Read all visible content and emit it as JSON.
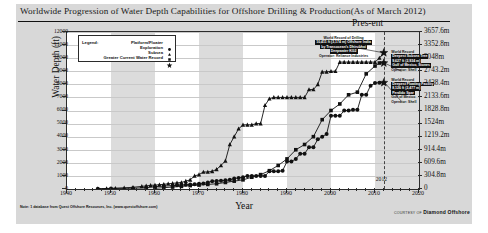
{
  "figure": {
    "title": "Worldwide Progression of Water Depth Capabilities for Offshore Drilling & Production(As of March 2012)",
    "present_label": "Pres-ent",
    "year_marker_label": "2012",
    "footnote": "Note: 1 database from Quest Offshore Resources, Inc. (www.questoffshore.com)",
    "courtesy_prefix": "COURTESY OF",
    "courtesy_brand": "Diamond Offshore"
  },
  "legend": {
    "title": "Legend:",
    "items": [
      {
        "label": "Platform/Floater",
        "marker": "circle-marker"
      },
      {
        "label": "Exploration",
        "marker": "triangle-marker"
      },
      {
        "label": "Subsea",
        "marker": "square-marker"
      },
      {
        "label": "Greater Current Water Record",
        "marker": "star-marker"
      }
    ]
  },
  "annotations": [
    {
      "name": "annotation-drilling-record",
      "lines": [
        "World Record of Drilling",
        "10,411 ft (3,174 m) Offshore India",
        "by Transocean's Dhirubhai",
        "Deepwater KG2",
        "Operator: Reliance Industries"
      ]
    },
    {
      "name": "annotation-subsea-record",
      "lines": [
        "World Record",
        "Deepest Subsea Tree",
        "9,627 ft (2,934 m)",
        "Gulf of Mexico, Stones",
        "Operator: Shell"
      ]
    },
    {
      "name": "annotation-platform-record",
      "lines": [
        "World Record",
        "Deepest Floating Facility",
        "8,126 ft (2,477 m)",
        "Perdido Spar",
        "Gulf of Mexico",
        "Operator: Shell"
      ]
    }
  ],
  "chart_data": {
    "type": "line",
    "title": "Worldwide Progression of Water Depth Capabilities for Offshore Drilling & Production(As of March 2012)",
    "xlabel": "Year",
    "ylabel": "Water Depth (ft)",
    "ylabel_right": "Water Depth (m)",
    "xlim": [
      1940,
      2020
    ],
    "ylim": [
      0,
      12000
    ],
    "grid": true,
    "legend_position": "top-left",
    "x_ticks": [
      1940,
      1950,
      1960,
      1970,
      1980,
      1990,
      2000,
      2010,
      2020
    ],
    "y_ticks": [
      0,
      1000,
      2000,
      3000,
      4000,
      5000,
      6000,
      7000,
      8000,
      9000,
      10000,
      11000,
      12000
    ],
    "y_ticks_right_m": [
      "0",
      "304.8m",
      "609.6m",
      "914.4m",
      "1219.2m",
      "1524m",
      "1828.8m",
      "2133.6m",
      "2438.4m",
      "2743.2m",
      "3048m",
      "3352.8m",
      "3657.6m"
    ],
    "series": [
      {
        "name": "Exploration",
        "marker": "triangle-marker",
        "x": [
          1947,
          1949,
          1951,
          1953,
          1955,
          1957,
          1958,
          1959,
          1960,
          1961,
          1962,
          1963,
          1964,
          1965,
          1966,
          1967,
          1968,
          1969,
          1970,
          1971,
          1972,
          1973,
          1974,
          1975,
          1976,
          1977,
          1978,
          1979,
          1980,
          1981,
          1982,
          1983,
          1984,
          1985,
          1986,
          1987,
          1988,
          1989,
          1990,
          1991,
          1992,
          1993,
          1994,
          1995,
          1996,
          1997,
          1998,
          1999,
          2000,
          2001,
          2002,
          2003,
          2004,
          2005,
          2006,
          2007,
          2008,
          2009,
          2010,
          2011,
          2012
        ],
        "values": [
          20,
          40,
          60,
          90,
          130,
          200,
          240,
          280,
          300,
          330,
          360,
          400,
          430,
          470,
          500,
          600,
          700,
          1000,
          1100,
          1300,
          1300,
          1350,
          1500,
          1800,
          2150,
          3400,
          4000,
          4600,
          4900,
          4900,
          4900,
          5000,
          5000,
          6400,
          6900,
          7000,
          7000,
          7000,
          7000,
          7000,
          7000,
          7000,
          7000,
          7600,
          7600,
          8000,
          8950,
          8950,
          9000,
          9000,
          9700,
          9700,
          9700,
          9700,
          9700,
          9700,
          9700,
          9700,
          9700,
          10011,
          10411
        ]
      },
      {
        "name": "Platform/Floater",
        "marker": "circle-marker",
        "x": [
          1947,
          1950,
          1955,
          1958,
          1960,
          1962,
          1964,
          1965,
          1966,
          1967,
          1968,
          1969,
          1970,
          1971,
          1972,
          1973,
          1974,
          1975,
          1976,
          1977,
          1978,
          1979,
          1980,
          1981,
          1982,
          1983,
          1984,
          1985,
          1986,
          1987,
          1988,
          1989,
          1990,
          1991,
          1992,
          1993,
          1994,
          1995,
          1996,
          1997,
          1998,
          1999,
          2000,
          2001,
          2002,
          2003,
          2004,
          2005,
          2006,
          2007,
          2008,
          2009,
          2010,
          2011,
          2012
        ],
        "values": [
          20,
          40,
          60,
          100,
          180,
          220,
          250,
          280,
          300,
          320,
          350,
          370,
          400,
          420,
          500,
          600,
          620,
          640,
          660,
          700,
          800,
          850,
          900,
          1000,
          1000,
          1000,
          1000,
          1000,
          1350,
          1350,
          1350,
          1400,
          2100,
          2100,
          2300,
          2700,
          2700,
          3200,
          3200,
          3800,
          4000,
          4200,
          5600,
          5600,
          5600,
          6000,
          6000,
          6050,
          6050,
          7200,
          7200,
          7900,
          8100,
          8126,
          8126
        ]
      },
      {
        "name": "Subsea",
        "marker": "square-marker",
        "x": [
          1960,
          1962,
          1964,
          1966,
          1968,
          1970,
          1972,
          1974,
          1976,
          1978,
          1980,
          1982,
          1984,
          1986,
          1988,
          1990,
          1992,
          1994,
          1996,
          1998,
          2000,
          2002,
          2004,
          2006,
          2008,
          2010,
          2011,
          2012
        ],
        "values": [
          60,
          100,
          150,
          200,
          260,
          300,
          350,
          400,
          500,
          600,
          700,
          900,
          1100,
          1400,
          1800,
          2300,
          3000,
          3400,
          4000,
          5300,
          6000,
          6500,
          7200,
          7400,
          8800,
          9400,
          9627,
          9627
        ]
      }
    ],
    "record_markers": [
      {
        "name": "record-drilling",
        "x": 2012,
        "y": 10411,
        "marker": "star-marker"
      },
      {
        "name": "record-subsea",
        "x": 2012,
        "y": 9627,
        "marker": "star-marker"
      },
      {
        "name": "record-platform",
        "x": 2012,
        "y": 8126,
        "marker": "star-marker"
      }
    ]
  }
}
